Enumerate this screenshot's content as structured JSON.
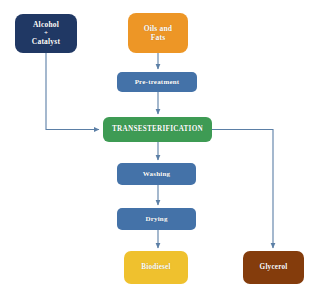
{
  "diagram": {
    "background_color": "#FFFFFF",
    "connector_color": "#5B7FA6",
    "nodes": {
      "alcohol": {
        "line1": "Alcohol",
        "plus": "+",
        "line2": "Catalyst",
        "color": "#203864",
        "text_color": "#FFFFFF",
        "shape": "rounded-rectangle"
      },
      "oils": {
        "line1": "Oils and",
        "line2": "Fats",
        "color": "#ED9626",
        "text_color": "#FFFFFF",
        "shape": "rounded-rectangle"
      },
      "pretreatment": {
        "label": "Pre-treatment",
        "color": "#4472A8",
        "text_color": "#FFFFFF",
        "shape": "rounded-rectangle"
      },
      "transesterification": {
        "label": "TRANSESTERIFICATION",
        "color": "#3E9B54",
        "text_color": "#FFFFFF",
        "shape": "rounded-rectangle"
      },
      "washing": {
        "label": "Washing",
        "color": "#4472A8",
        "text_color": "#FFFFFF",
        "shape": "rounded-rectangle"
      },
      "drying": {
        "label": "Drying",
        "color": "#4472A8",
        "text_color": "#FFFFFF",
        "shape": "rounded-rectangle"
      },
      "biodiesel": {
        "label": "Biodiesel",
        "color": "#EFC12E",
        "text_color": "#FFFFFF",
        "shape": "rounded-rectangle"
      },
      "glycerol": {
        "label": "Glycerol",
        "color": "#843C0C",
        "text_color": "#FFFFFF",
        "shape": "rounded-rectangle"
      }
    },
    "edges": [
      {
        "from": "oils",
        "to": "pretreatment",
        "style": "arrow-down"
      },
      {
        "from": "pretreatment",
        "to": "transesterification",
        "style": "arrow-down"
      },
      {
        "from": "alcohol",
        "to": "transesterification",
        "style": "elbow-down-right-arrow"
      },
      {
        "from": "transesterification",
        "to": "washing",
        "style": "arrow-down"
      },
      {
        "from": "washing",
        "to": "drying",
        "style": "arrow-down"
      },
      {
        "from": "drying",
        "to": "biodiesel",
        "style": "arrow-down"
      },
      {
        "from": "transesterification",
        "to": "glycerol",
        "style": "elbow-right-down-arrow"
      }
    ]
  }
}
